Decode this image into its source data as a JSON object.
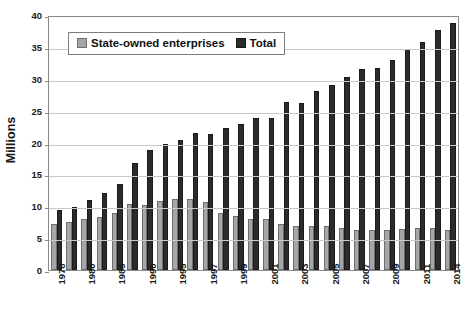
{
  "chart_data": {
    "type": "bar",
    "title": "",
    "subtitle": "",
    "xlabel": "",
    "ylabel": "Millions",
    "ylim": [
      0,
      40
    ],
    "ytick_step": 5,
    "yticks": [
      "0",
      "5",
      "10",
      "15",
      "20",
      "25",
      "30",
      "35",
      "40"
    ],
    "grid": true,
    "legend_position": "top-left-inside",
    "categories": [
      "1978",
      "1979",
      "1980",
      "1981",
      "1985",
      "1986",
      "1990",
      "1991",
      "1995",
      "1996",
      "1997",
      "1998",
      "1999",
      "2000",
      "2001",
      "2002",
      "2003",
      "2004",
      "2005",
      "2006",
      "2007",
      "2008",
      "2009",
      "2010",
      "2011",
      "2012",
      "2014"
    ],
    "tick_labels_shown": [
      "1978",
      "",
      "1980",
      "",
      "1985",
      "",
      "1990",
      "",
      "1995",
      "",
      "1997",
      "",
      "1999",
      "",
      "2001",
      "",
      "2003",
      "",
      "2005",
      "",
      "2007",
      "",
      "2009",
      "",
      "2011",
      "",
      "2014"
    ],
    "series": [
      {
        "name": "State-owned enterprises",
        "color": "#a6a6a6",
        "values": [
          7.3,
          7.6,
          8.0,
          8.4,
          9.0,
          10.4,
          10.3,
          10.9,
          11.2,
          11.2,
          10.8,
          9.0,
          8.6,
          8.1,
          8.0,
          7.2,
          7.0,
          6.9,
          6.9,
          6.7,
          6.4,
          6.4,
          6.4,
          6.5,
          6.6,
          6.6,
          6.3
        ]
      },
      {
        "name": "Total",
        "color": "#2b2b2b",
        "values": [
          9.5,
          10.0,
          11.0,
          12.2,
          13.6,
          16.9,
          18.9,
          19.9,
          20.6,
          21.6,
          21.5,
          22.4,
          23.1,
          24.0,
          24.0,
          26.5,
          26.4,
          28.3,
          29.3,
          30.5,
          31.8,
          32.0,
          33.2,
          35.0,
          36.1,
          38.0,
          39.0
        ]
      }
    ],
    "legend": [
      {
        "label": "State-owned enterprises",
        "swatch": "gray-square"
      },
      {
        "label": "Total",
        "swatch": "dark-square"
      }
    ]
  }
}
